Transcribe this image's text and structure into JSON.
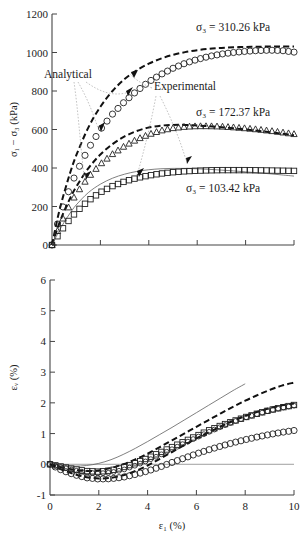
{
  "figure": {
    "title": "",
    "panels": [
      "deviator-stress-vs-axial-strain",
      "volumetric-strain-vs-axial-strain"
    ],
    "annotations": {
      "analytical": "Analytical",
      "experimental": "Experimental"
    },
    "series_labels": {
      "s3_310": "σ₃ = 310.26 kPa",
      "s3_172": "σ₃ = 172.37 kPa",
      "s3_103": "σ₃ = 103.42 kPa"
    },
    "axis_titles": {
      "top_y": "σ₁ − σ₃ (kPa)",
      "bottom_y": "εᵥ (%)",
      "bottom_x": "ε₁ (%)"
    }
  },
  "chart_data": [
    {
      "id": "top",
      "type": "line",
      "title": "",
      "xlabel": "",
      "ylabel": "σ₁ − σ₃ (kPa)",
      "xlim": [
        0,
        10
      ],
      "ylim": [
        0,
        1200
      ],
      "xticks": [
        0,
        2,
        4,
        6,
        8,
        10
      ],
      "xticklabels": [
        "",
        "",
        "",
        "",
        "",
        ""
      ],
      "yticks": [
        0,
        200,
        400,
        600,
        800,
        1000,
        1200
      ],
      "yticklabels": [
        "0",
        "200",
        "400",
        "600",
        "800",
        "1000",
        "1200"
      ],
      "grid": false,
      "legend": "none",
      "x": [
        0,
        0.25,
        0.5,
        0.75,
        1,
        1.5,
        2,
        2.5,
        3,
        3.5,
        4,
        4.5,
        5,
        5.5,
        6,
        6.5,
        7,
        7.5,
        8,
        8.5,
        9,
        9.5,
        10
      ],
      "series": [
        {
          "name": "Analytical σ₃ = 310.26 kPa",
          "style": "dashed-heavy",
          "values": [
            0,
            150,
            270,
            375,
            465,
            610,
            718,
            800,
            862,
            908,
            942,
            968,
            988,
            1002,
            1012,
            1019,
            1024,
            1027,
            1029,
            1030,
            1031,
            1031,
            1031
          ]
        },
        {
          "name": "Experimental σ₃ = 310.26 kPa",
          "style": "open-circle",
          "values": [
            0,
            120,
            215,
            300,
            375,
            500,
            600,
            680,
            745,
            800,
            848,
            886,
            918,
            944,
            964,
            980,
            992,
            1000,
            1006,
            1010,
            1012,
            1010,
            1002
          ]
        },
        {
          "name": "Analytical σ₃ = 172.37 kPa",
          "style": "dashed-heavy",
          "values": [
            0,
            95,
            175,
            243,
            302,
            398,
            470,
            524,
            564,
            592,
            610,
            620,
            624,
            624,
            621,
            617,
            612,
            606,
            600,
            593,
            586,
            578,
            570
          ]
        },
        {
          "name": "Experimental σ₃ = 172.37 kPa",
          "style": "open-triangle",
          "values": [
            0,
            80,
            150,
            212,
            266,
            352,
            420,
            472,
            514,
            548,
            574,
            594,
            607,
            614,
            617,
            617,
            615,
            611,
            606,
            600,
            593,
            585,
            576
          ]
        },
        {
          "name": "Analytical σ₃ = 103.42 kPa",
          "style": "thin-solid",
          "values": [
            0,
            62,
            118,
            166,
            208,
            272,
            316,
            347,
            368,
            382,
            391,
            396,
            398,
            398,
            396,
            393,
            389,
            385,
            380,
            375,
            370,
            364,
            358
          ]
        },
        {
          "name": "Experimental σ₃ = 103.42 kPa",
          "style": "open-square",
          "values": [
            0,
            50,
            95,
            136,
            172,
            230,
            274,
            306,
            330,
            348,
            361,
            371,
            378,
            383,
            386,
            388,
            389,
            389,
            389,
            388,
            387,
            386,
            385
          ]
        }
      ]
    },
    {
      "id": "bottom",
      "type": "line",
      "title": "",
      "xlabel": "ε₁ (%)",
      "ylabel": "εᵥ (%)",
      "xlim": [
        0,
        10
      ],
      "ylim": [
        -1,
        6
      ],
      "xticks": [
        0,
        2,
        4,
        6,
        8,
        10
      ],
      "xticklabels": [
        "0",
        "2",
        "4",
        "6",
        "8",
        "10"
      ],
      "yticks": [
        -1,
        0,
        1,
        2,
        3,
        4,
        5,
        6
      ],
      "yticklabels": [
        "-1",
        "0",
        "1",
        "2",
        "3",
        "4",
        "5",
        "6"
      ],
      "grid": false,
      "legend": "none",
      "x": [
        0,
        0.5,
        1,
        1.5,
        2,
        2.5,
        3,
        3.5,
        4,
        4.5,
        5,
        5.5,
        6,
        6.5,
        7,
        7.5,
        8,
        8.5,
        9,
        9.5,
        10
      ],
      "series": [
        {
          "name": "Analytical σ₃ = 103.42 kPa",
          "style": "thin-solid",
          "values": [
            0,
            -0.04,
            -0.06,
            -0.04,
            0.03,
            0.15,
            0.32,
            0.52,
            0.74,
            0.97,
            1.2,
            1.44,
            1.68,
            1.92,
            2.16,
            2.4,
            2.62,
            null,
            null,
            null,
            null
          ]
        },
        {
          "name": "Analytical σ₃ = 172.37 kPa",
          "style": "dashed-heavy",
          "values": [
            0,
            -0.1,
            -0.18,
            -0.22,
            -0.2,
            -0.12,
            0.0,
            0.16,
            0.35,
            0.56,
            0.78,
            1.0,
            1.22,
            1.44,
            1.66,
            1.87,
            2.07,
            2.25,
            2.42,
            2.56,
            2.66
          ]
        },
        {
          "name": "Analytical σ₃ = 310.26 kPa",
          "style": "dashed-heavy",
          "values": [
            0,
            -0.18,
            -0.32,
            -0.42,
            -0.46,
            -0.44,
            -0.36,
            -0.22,
            -0.04,
            0.18,
            0.4,
            0.62,
            0.84,
            1.04,
            1.23,
            1.41,
            1.57,
            1.71,
            1.83,
            1.92,
            1.98
          ]
        },
        {
          "name": "Experimental σ₃ = 103.42 kPa",
          "style": "open-square",
          "values": [
            0,
            -0.08,
            -0.16,
            -0.22,
            -0.24,
            -0.2,
            -0.1,
            0.04,
            0.2,
            0.38,
            0.56,
            0.74,
            0.92,
            1.1,
            1.26,
            1.4,
            1.53,
            1.65,
            1.76,
            1.85,
            1.93
          ]
        },
        {
          "name": "Experimental σ₃ = 172.37 kPa",
          "style": "open-circle-small",
          "values": [
            0,
            -0.1,
            -0.2,
            -0.27,
            -0.3,
            -0.27,
            -0.18,
            -0.04,
            0.12,
            0.3,
            0.49,
            0.68,
            0.87,
            1.05,
            1.22,
            1.38,
            1.52,
            1.64,
            1.75,
            1.84,
            1.91
          ]
        },
        {
          "name": "Experimental σ₃ = 310.26 kPa",
          "style": "open-circle",
          "values": [
            0,
            -0.2,
            -0.34,
            -0.44,
            -0.48,
            -0.47,
            -0.42,
            -0.33,
            -0.22,
            -0.09,
            0.06,
            0.2,
            0.34,
            0.47,
            0.59,
            0.7,
            0.8,
            0.89,
            0.97,
            1.04,
            1.1
          ]
        }
      ]
    }
  ]
}
